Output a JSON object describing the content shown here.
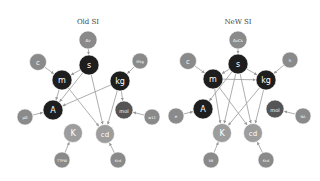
{
  "diagrams": [
    {
      "title": "Old SI",
      "nodes": {
        "dnu": {
          "label": "Δν",
          "x": 88,
          "y": 40,
          "r": 9,
          "color": "#8a8a8a",
          "size": 4
        },
        "c": {
          "label": "c",
          "x": 38,
          "y": 62,
          "r": 8.5,
          "color": "#8a8a8a",
          "size": 7
        },
        "s": {
          "label": "s",
          "x": 89,
          "y": 65,
          "r": 10,
          "color": "#1e1e1e",
          "size": 8
        },
        "Mkg": {
          "label": "Mkg",
          "x": 140,
          "y": 61,
          "r": 8,
          "color": "#8a8a8a",
          "size": 3.5
        },
        "m": {
          "label": "m",
          "x": 62,
          "y": 80,
          "r": 10,
          "color": "#1e1e1e",
          "size": 8
        },
        "kg": {
          "label": "kg",
          "x": 120,
          "y": 81,
          "r": 10,
          "color": "#1e1e1e",
          "size": 8
        },
        "A": {
          "label": "A",
          "x": 53,
          "y": 110,
          "r": 10,
          "color": "#1e1e1e",
          "size": 8
        },
        "mu0": {
          "label": "μ0",
          "x": 25,
          "y": 117,
          "r": 8,
          "color": "#8a8a8a",
          "size": 4
        },
        "mol": {
          "label": "mol",
          "x": 124,
          "y": 110,
          "r": 9,
          "color": "#555555",
          "size": 5
        },
        "w12": {
          "label": "w12",
          "x": 152,
          "y": 117,
          "r": 8,
          "color": "#8a8a8a",
          "size": 3.5
        },
        "K": {
          "label": "K",
          "x": 73,
          "y": 133,
          "r": 9.5,
          "color": "#9d9d9d",
          "size": 8
        },
        "cd": {
          "label": "cd",
          "x": 105,
          "y": 134,
          "r": 9.5,
          "color": "#9d9d9d",
          "size": 7
        },
        "Ttpw": {
          "label": "TTPW",
          "x": 62,
          "y": 160,
          "r": 8,
          "color": "#8a8a8a",
          "size": 3.5
        },
        "Kcd": {
          "label": "Kcd",
          "x": 118,
          "y": 160,
          "r": 8,
          "color": "#8a8a8a",
          "size": 3.5
        }
      },
      "edges": [
        [
          "dnu",
          "s"
        ],
        [
          "c",
          "m"
        ],
        [
          "s",
          "m"
        ],
        [
          "Mkg",
          "kg"
        ],
        [
          "s",
          "A"
        ],
        [
          "m",
          "A"
        ],
        [
          "kg",
          "A"
        ],
        [
          "mu0",
          "A"
        ],
        [
          "s",
          "cd"
        ],
        [
          "m",
          "cd"
        ],
        [
          "kg",
          "cd"
        ],
        [
          "kg",
          "mol"
        ],
        [
          "w12",
          "mol"
        ],
        [
          "Ttpw",
          "K"
        ],
        [
          "Kcd",
          "cd"
        ]
      ]
    },
    {
      "title": "NeW SI",
      "nodes": {
        "dnu": {
          "label": "ΔνCs",
          "x": 238,
          "y": 40,
          "r": 9,
          "color": "#8a8a8a",
          "size": 4
        },
        "c": {
          "label": "c",
          "x": 188,
          "y": 61,
          "r": 8.5,
          "color": "#8a8a8a",
          "size": 7
        },
        "s": {
          "label": "s",
          "x": 238,
          "y": 64,
          "r": 10,
          "color": "#1e1e1e",
          "size": 8
        },
        "h": {
          "label": "h",
          "x": 290,
          "y": 60,
          "r": 8,
          "color": "#8a8a8a",
          "size": 4
        },
        "m": {
          "label": "m",
          "x": 213,
          "y": 79,
          "r": 10,
          "color": "#1e1e1e",
          "size": 8
        },
        "kg": {
          "label": "kg",
          "x": 266,
          "y": 80,
          "r": 10,
          "color": "#1e1e1e",
          "size": 8
        },
        "A": {
          "label": "A",
          "x": 203,
          "y": 109,
          "r": 10,
          "color": "#1e1e1e",
          "size": 8
        },
        "e": {
          "label": "e",
          "x": 176,
          "y": 116,
          "r": 8,
          "color": "#8a8a8a",
          "size": 4
        },
        "mol": {
          "label": "mol",
          "x": 275,
          "y": 109,
          "r": 9,
          "color": "#555555",
          "size": 5
        },
        "NA": {
          "label": "NA",
          "x": 303,
          "y": 116,
          "r": 8,
          "color": "#8a8a8a",
          "size": 3.5
        },
        "K": {
          "label": "K",
          "x": 222,
          "y": 133,
          "r": 9.5,
          "color": "#9d9d9d",
          "size": 8
        },
        "cd": {
          "label": "cd",
          "x": 253,
          "y": 133,
          "r": 9.5,
          "color": "#9d9d9d",
          "size": 7
        },
        "kB": {
          "label": "kB",
          "x": 211,
          "y": 160,
          "r": 8,
          "color": "#8a8a8a",
          "size": 3.5
        },
        "Kcd": {
          "label": "Kcd",
          "x": 266,
          "y": 160,
          "r": 8,
          "color": "#8a8a8a",
          "size": 3.5
        }
      },
      "edges": [
        [
          "dnu",
          "s"
        ],
        [
          "c",
          "m"
        ],
        [
          "s",
          "m"
        ],
        [
          "s",
          "kg"
        ],
        [
          "m",
          "kg"
        ],
        [
          "h",
          "kg"
        ],
        [
          "s",
          "A"
        ],
        [
          "e",
          "A"
        ],
        [
          "s",
          "K"
        ],
        [
          "m",
          "K"
        ],
        [
          "kg",
          "K"
        ],
        [
          "s",
          "cd"
        ],
        [
          "m",
          "cd"
        ],
        [
          "kg",
          "cd"
        ],
        [
          "NA",
          "mol"
        ],
        [
          "kB",
          "K"
        ],
        [
          "Kcd",
          "cd"
        ]
      ]
    }
  ],
  "titles": {
    "left": "Old SI",
    "right": "NeW SI"
  }
}
